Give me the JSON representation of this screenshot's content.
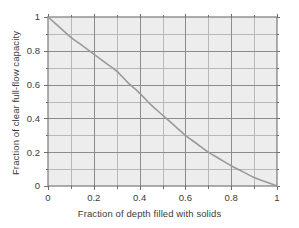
{
  "figure": {
    "title": "",
    "background_color": "#ffffff",
    "plot_background_color": "#ededed",
    "grid_color": "#8c8c8c",
    "minor_grid_color": "#b9b9b9",
    "axis_color": "#6e6e6e",
    "curve_color": "#9a9a9a",
    "tick_label_color": "#3b3b3b"
  },
  "axes": {
    "x": {
      "label": "Fraction of depth filled with solids",
      "tick_labels": [
        "0",
        "0.2",
        "0.4",
        "0.6",
        "0.8",
        "1"
      ],
      "tick_values": [
        0,
        0.2,
        0.4,
        0.6,
        0.8,
        1
      ],
      "minor_tick_values": [
        0.1,
        0.3,
        0.5,
        0.7,
        0.9
      ],
      "range": [
        0,
        1
      ]
    },
    "y": {
      "label": "Fraction of clear full-flow capacity",
      "tick_labels": [
        "0",
        "0.2",
        "0.4",
        "0.6",
        "0.8",
        "1"
      ],
      "tick_values": [
        0,
        0.2,
        0.4,
        0.6,
        0.8,
        1
      ],
      "minor_tick_values": [
        0.1,
        0.3,
        0.5,
        0.7,
        0.9
      ],
      "range": [
        0,
        1
      ]
    }
  },
  "chart_data": {
    "type": "line",
    "title": "",
    "xlabel": "Fraction of depth filled with solids",
    "ylabel": "Fraction of clear full-flow capacity",
    "xlim": [
      0,
      1
    ],
    "ylim": [
      0,
      1
    ],
    "grid": true,
    "legend": null,
    "legend_position": "none",
    "series": [
      {
        "name": "Fraction of clear full-flow capacity",
        "color": "#9a9a9a",
        "x": [
          0.0,
          0.05,
          0.1,
          0.15,
          0.2,
          0.25,
          0.3,
          0.35,
          0.4,
          0.45,
          0.5,
          0.55,
          0.6,
          0.65,
          0.7,
          0.75,
          0.8,
          0.85,
          0.9,
          0.95,
          1.0
        ],
        "values": [
          1.0,
          0.94,
          0.88,
          0.83,
          0.78,
          0.73,
          0.68,
          0.61,
          0.55,
          0.48,
          0.42,
          0.36,
          0.3,
          0.25,
          0.2,
          0.16,
          0.12,
          0.085,
          0.05,
          0.025,
          0.0
        ]
      }
    ]
  }
}
